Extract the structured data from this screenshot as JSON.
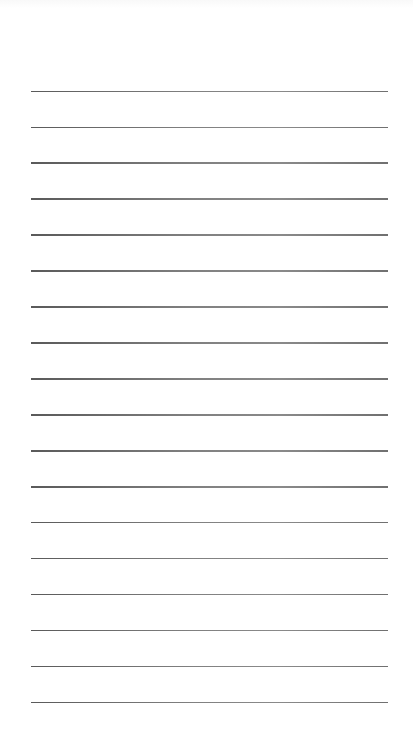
{
  "page": {
    "kind": "blank lined paper",
    "line_count": 18,
    "line_color": "#7a7a7a",
    "background_color": "#ffffff"
  }
}
